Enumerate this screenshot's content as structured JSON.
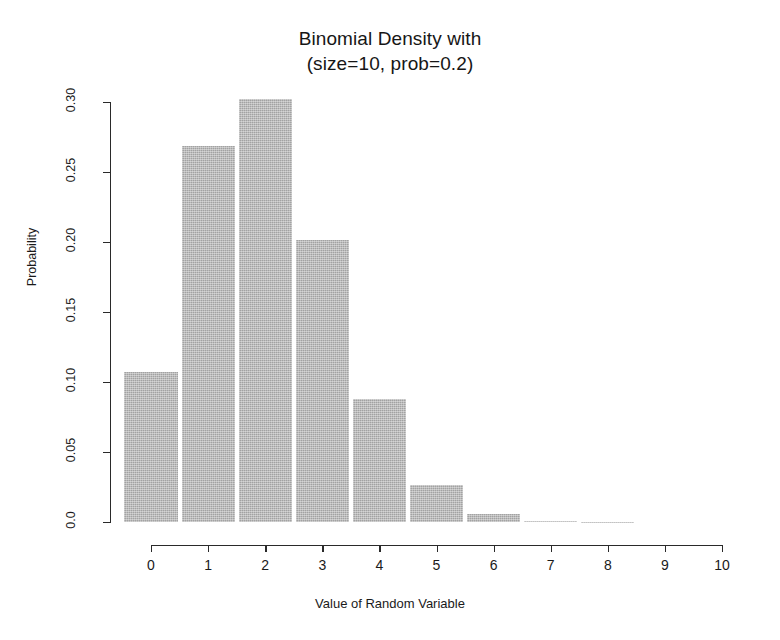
{
  "chart_data": {
    "type": "bar",
    "title": "Binomial Density with",
    "subtitle": "(size=10, prob=0.2)",
    "xlabel": "Value of Random Variable",
    "ylabel": "Probability",
    "categories": [
      "0",
      "1",
      "2",
      "3",
      "4",
      "5",
      "6",
      "7",
      "8",
      "9",
      "10"
    ],
    "values": [
      0.1074,
      0.2684,
      0.302,
      0.2013,
      0.0881,
      0.0264,
      0.0055,
      0.0008,
      0.0001,
      0.0,
      0.0
    ],
    "x": [
      0,
      1,
      2,
      3,
      4,
      5,
      6,
      7,
      8,
      9,
      10
    ],
    "xlim": [
      -0.5,
      10.5
    ],
    "ylim": [
      0,
      0.3
    ],
    "xticks": [
      "0",
      "1",
      "2",
      "3",
      "4",
      "5",
      "6",
      "7",
      "8",
      "9",
      "10"
    ],
    "yticks": [
      "0.0",
      "0.05",
      "0.10",
      "0.15",
      "0.20",
      "0.25",
      "0.30"
    ],
    "ytick_values": [
      0.0,
      0.05,
      0.1,
      0.15,
      0.2,
      0.25,
      0.3
    ],
    "grid": false,
    "legend": false,
    "bar_color": "#b4b4b4",
    "axis_color": "#2a2a2a"
  },
  "plot": {
    "title_line1": "Binomial Density with",
    "title_line2": "(size=10, prob=0.2)",
    "y_axis_title": "Probability",
    "x_axis_title": "Value of Random Variable"
  }
}
